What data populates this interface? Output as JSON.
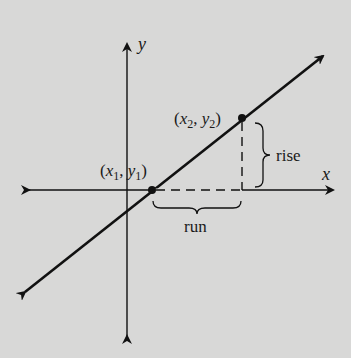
{
  "diagram": {
    "type": "slope-of-line",
    "axes": {
      "x_label": "x",
      "y_label": "y"
    },
    "points": [
      {
        "label_open": "(",
        "var1": "x",
        "sub1": "1",
        "sep": ", ",
        "var2": "y",
        "sub2": "1",
        "label_close": ")"
      },
      {
        "label_open": "(",
        "var1": "x",
        "sub1": "2",
        "sep": ", ",
        "var2": "y",
        "sub2": "2",
        "label_close": ")"
      }
    ],
    "braces": {
      "rise": "rise",
      "run": "run"
    },
    "colors": {
      "background": "#d8d8d7",
      "ink": "#111111"
    }
  }
}
